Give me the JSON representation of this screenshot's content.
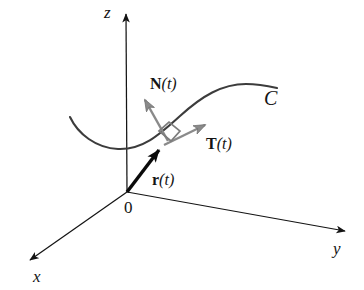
{
  "figure": {
    "background_color": "#ffffff",
    "axis_color": "#141414",
    "curve_color": "#3c3c3c",
    "position_vector_color": "#0a0a0a",
    "unit_vector_color": "#7d7d7d",
    "right_angle_color": "#7d7d7d"
  },
  "axes": {
    "x": {
      "label": "x",
      "tip": [
        22,
        265
      ],
      "label_pos": [
        33,
        268
      ]
    },
    "y": {
      "label": "y",
      "tip": [
        352,
        232
      ],
      "label_pos": [
        333,
        240
      ]
    },
    "z": {
      "label": "z",
      "tip": [
        126,
        9
      ],
      "label_pos": [
        104,
        4
      ]
    },
    "origin": {
      "label": "0",
      "point": [
        127,
        192
      ],
      "label_pos": [
        124,
        199
      ]
    }
  },
  "curve": {
    "label": "C",
    "label_pos": [
      264,
      88
    ],
    "start": [
      70,
      117
    ],
    "end": [
      277,
      88
    ],
    "min_point": [
      116,
      149
    ],
    "max_point": [
      252,
      85
    ]
  },
  "vectors": [
    {
      "name": "position-vector",
      "label_bold": "r",
      "label_arg": "(t)",
      "label_pos": [
        152,
        172
      ],
      "from": [
        127,
        192
      ],
      "to": [
        163,
        145
      ],
      "color": "#0a0a0a",
      "style": "thick-black"
    },
    {
      "name": "unit-tangent-vector",
      "label_bold": "T",
      "label_arg": "(t)",
      "label_pos": [
        206,
        136
      ],
      "from": [
        164,
        145
      ],
      "to": [
        213,
        121
      ],
      "color": "#7d7d7d",
      "style": "gray"
    },
    {
      "name": "unit-normal-vector",
      "label_bold": "N",
      "label_arg": "(t)",
      "label_pos": [
        150,
        76
      ],
      "from": [
        168,
        141
      ],
      "to": [
        140,
        92
      ],
      "color": "#7d7d7d",
      "style": "gray"
    }
  ],
  "right_angle_marker": {
    "name": "right-angle-marker",
    "corner": [
      166,
      136
    ],
    "size": 13
  }
}
